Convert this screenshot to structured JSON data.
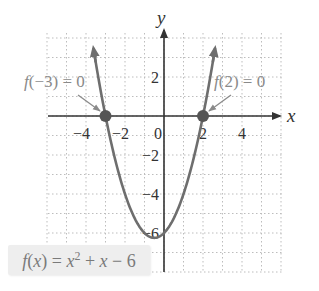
{
  "chart_data": {
    "type": "line",
    "title": "",
    "function": "f(x) = x^2 + x - 6",
    "xlabel": "x",
    "ylabel": "y",
    "xlim": [
      -6,
      6
    ],
    "ylim": [
      -8,
      4
    ],
    "grid": true,
    "x_ticks": [
      -4,
      -2,
      0,
      2,
      4
    ],
    "y_ticks": [
      2,
      -2,
      -4,
      -6
    ],
    "tick_labels": {
      "x": [
        "−4",
        "−2",
        "0",
        "2",
        "4"
      ],
      "y": [
        "2",
        "−2",
        "−4",
        "−6"
      ]
    },
    "series": [
      {
        "name": "f(x) = x² + x − 6",
        "x": [
          -4,
          -3.5,
          -3,
          -2.5,
          -2,
          -1.5,
          -1,
          -0.5,
          0,
          0.5,
          1,
          1.5,
          2,
          2.5,
          3
        ],
        "y": [
          6,
          2.75,
          0,
          -2.25,
          -4,
          -5.25,
          -6,
          -6.25,
          -6,
          -5.25,
          -4,
          -2.25,
          0,
          2.75,
          6
        ]
      }
    ],
    "points": [
      {
        "x": -3,
        "y": 0,
        "label": "f(−3) = 0"
      },
      {
        "x": 2,
        "y": 0,
        "label": "f(2) = 0"
      }
    ],
    "annotations": [
      "f(−3) = 0",
      "f(2) = 0",
      "f(x) = x² + x − 6"
    ]
  },
  "labels": {
    "x_axis": "x",
    "y_axis": "y",
    "zero_left_lhs": "f(−3)",
    "zero_left_rhs": " = 0",
    "zero_right_lhs": "f(2)",
    "zero_right_rhs": " = 0",
    "function_label": "f(x) = x² + x − 6"
  },
  "colors": {
    "curve": "#6e6e6e",
    "axes": "#333333",
    "grid": "#bdbdbd",
    "points": "#555555",
    "annotation": "#8a8a8a",
    "label_box": "#eeeeee"
  }
}
